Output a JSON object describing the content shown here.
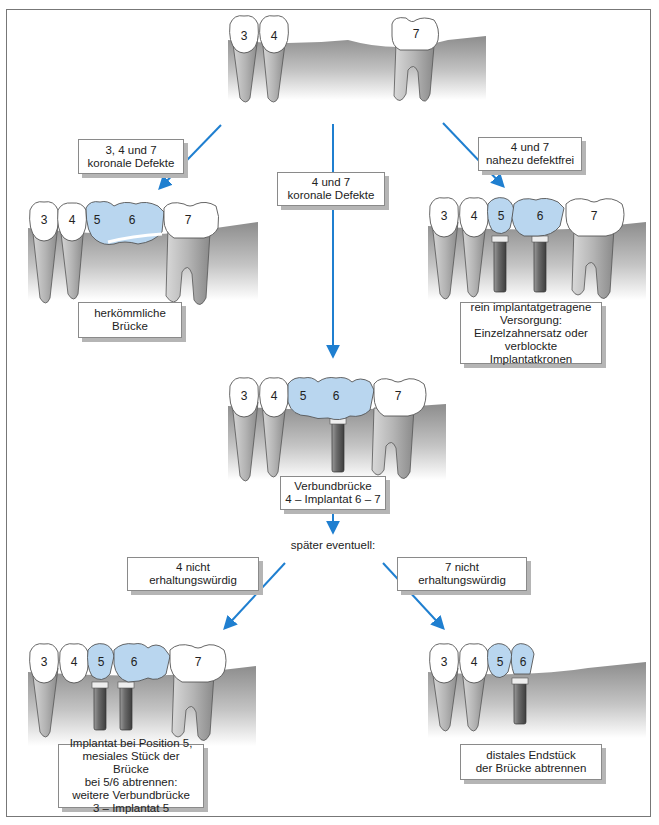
{
  "diagram": {
    "type": "dental treatment decision tree",
    "colors": {
      "arrow": "#1f7fd0",
      "crown_restoration": "#b9d6ef",
      "natural_crown": "#ffffff",
      "gingiva_bone": "#9a9a9a",
      "implant": "#6e6e6e",
      "frame": "#777777"
    },
    "top": {
      "teeth": [
        "3",
        "4",
        "7"
      ],
      "description": "Ausgangssituation: Zähne 3, 4 und 7 vorhanden, Lücke bei 5 und 6"
    },
    "branches": {
      "left": {
        "condition": "3, 4 und 7\nkoronale Defekte",
        "teeth": [
          "3",
          "4",
          "5",
          "6",
          "7"
        ],
        "result": "herkömmliche\nBrücke"
      },
      "center": {
        "condition": "4 und 7\nkoronale Defekte",
        "teeth": [
          "3",
          "4",
          "5",
          "6",
          "7"
        ],
        "result": "Verbundbrücke\n4 – Implantat 6 – 7"
      },
      "right": {
        "condition": "4 und 7\nnahezu defektfrei",
        "teeth": [
          "3",
          "4",
          "5",
          "6",
          "7"
        ],
        "result": "rein implantatgetragene\nVersorgung:\nEinzelzahnersatz oder\nverblockte Implantatkronen"
      }
    },
    "later": {
      "label": "später eventuell:",
      "left": {
        "condition": "4 nicht erhaltungswürdig",
        "teeth": [
          "3",
          "4",
          "5",
          "6",
          "7"
        ],
        "result": "Implantat bei Position 5,\nmesiales Stück der Brücke\nbei 5/6 abtrennen:\nweitere Verbundbrücke\n3 – Implantat 5"
      },
      "right": {
        "condition": "7 nicht erhaltungswürdig",
        "teeth": [
          "3",
          "4",
          "5",
          "6"
        ],
        "result": "distales Endstück\nder Brücke abtrennen"
      }
    }
  }
}
